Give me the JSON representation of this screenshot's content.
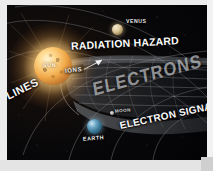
{
  "image": {
    "title": "Solar radiation and Earth magnetosphere diagram",
    "background_color": "#050506",
    "frame_color": "#ececec"
  },
  "labels": {
    "radiation_hazard": "RADIATION HAZARD",
    "ions": "IONS",
    "lines": "LINES",
    "electrons": "ELECTRONS",
    "electron_signal": "ELECTRON SIGNAL"
  },
  "bodies": {
    "sun": {
      "name": "SUN",
      "color": "#f0a848"
    },
    "venus": {
      "name": "VENUS",
      "color": "#ddc89c"
    },
    "earth": {
      "name": "EARTH",
      "color": "#35708f"
    },
    "moon": {
      "name": "MOON",
      "color": "#b4b4ad"
    }
  }
}
